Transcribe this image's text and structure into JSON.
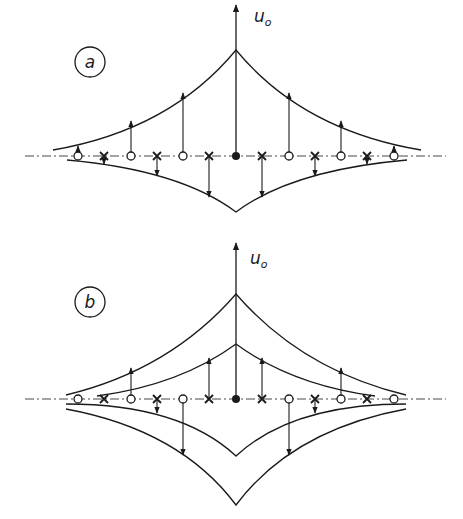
{
  "figure": {
    "panels": [
      {
        "id": "a",
        "label": "a",
        "axis_label": "u",
        "axis_label_sub": "o",
        "markers": [
          {
            "x": 78,
            "type": "open-circle",
            "arrow": "up",
            "to": 146
          },
          {
            "x": 104,
            "type": "cross",
            "arrow": "down",
            "to": 164
          },
          {
            "x": 131,
            "type": "open-circle",
            "arrow": "up",
            "to": 121
          },
          {
            "x": 157,
            "type": "cross",
            "arrow": "down",
            "to": 176
          },
          {
            "x": 183,
            "type": "open-circle",
            "arrow": "up",
            "to": 93
          },
          {
            "x": 209,
            "type": "cross",
            "arrow": "down",
            "to": 197
          },
          {
            "x": 236,
            "type": "filled-circle",
            "arrow": "up",
            "to": 50
          },
          {
            "x": 262,
            "type": "cross",
            "arrow": "down",
            "to": 197
          },
          {
            "x": 289,
            "type": "open-circle",
            "arrow": "up",
            "to": 93
          },
          {
            "x": 315,
            "type": "cross",
            "arrow": "down",
            "to": 176
          },
          {
            "x": 341,
            "type": "open-circle",
            "arrow": "up",
            "to": 121
          },
          {
            "x": 367,
            "type": "cross",
            "arrow": "down",
            "to": 164
          },
          {
            "x": 394,
            "type": "open-circle",
            "arrow": "up",
            "to": 146
          }
        ]
      },
      {
        "id": "b",
        "label": "b",
        "axis_label": "u",
        "axis_label_sub": "o",
        "markers": [
          {
            "x": 78,
            "type": "open-circle",
            "arrow": "none"
          },
          {
            "x": 104,
            "type": "cross",
            "arrow": "none"
          },
          {
            "x": 131,
            "type": "open-circle",
            "arrow": "up",
            "to": 368
          },
          {
            "x": 157,
            "type": "cross",
            "arrow": "down",
            "to": 413
          },
          {
            "x": 183,
            "type": "open-circle",
            "arrow": "down",
            "to": 455
          },
          {
            "x": 209,
            "type": "cross",
            "arrow": "up",
            "to": 358
          },
          {
            "x": 236,
            "type": "filled-circle",
            "arrow": "up",
            "to": 344
          },
          {
            "x": 262,
            "type": "cross",
            "arrow": "up",
            "to": 358
          },
          {
            "x": 289,
            "type": "open-circle",
            "arrow": "down",
            "to": 455
          },
          {
            "x": 315,
            "type": "cross",
            "arrow": "down",
            "to": 413
          },
          {
            "x": 341,
            "type": "open-circle",
            "arrow": "up",
            "to": 368
          },
          {
            "x": 367,
            "type": "cross",
            "arrow": "none"
          },
          {
            "x": 394,
            "type": "open-circle",
            "arrow": "none"
          }
        ]
      }
    ]
  }
}
